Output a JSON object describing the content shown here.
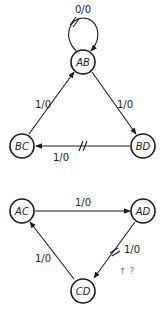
{
  "diagram": {
    "type": "state-transition-graph",
    "graphs": [
      {
        "nodes": [
          {
            "id": "AB",
            "label": "AB",
            "x": 83,
            "y": 62
          },
          {
            "id": "BC",
            "label": "BC",
            "x": 22,
            "y": 145
          },
          {
            "id": "BD",
            "label": "BD",
            "x": 143,
            "y": 145
          }
        ],
        "edges": [
          {
            "from": "AB",
            "to": "AB",
            "label": "0/0",
            "self_loop": true,
            "cut_mark": true
          },
          {
            "from": "BC",
            "to": "AB",
            "label": "1/0",
            "cut_mark": false
          },
          {
            "from": "AB",
            "to": "BD",
            "label": "1/0",
            "cut_mark": false
          },
          {
            "from": "BD",
            "to": "BC",
            "label": "1/0",
            "cut_mark": true
          }
        ]
      },
      {
        "nodes": [
          {
            "id": "AC",
            "label": "AC",
            "x": 22,
            "y": 208
          },
          {
            "id": "AD",
            "label": "AD",
            "x": 143,
            "y": 208
          },
          {
            "id": "CD",
            "label": "CD",
            "x": 83,
            "y": 290
          }
        ],
        "edges": [
          {
            "from": "AC",
            "to": "AD",
            "label": "1/0",
            "cut_mark": false
          },
          {
            "from": "AD",
            "to": "CD",
            "label": "1/0",
            "cut_mark": true
          },
          {
            "from": "CD",
            "to": "AC",
            "label": "1/0",
            "cut_mark": false
          }
        ]
      }
    ],
    "labels": {
      "ab": "AB",
      "bc": "BC",
      "bd": "BD",
      "ac": "AC",
      "ad": "AD",
      "cd": "CD",
      "loop_ab": "0/0",
      "bc_ab": "1/0",
      "ab_bd": "1/0",
      "bd_bc": "1/0",
      "ac_ad": "1/0",
      "ad_cd": "1/0",
      "cd_ac": "1/0",
      "stray_mark": "↑ ? "
    }
  }
}
